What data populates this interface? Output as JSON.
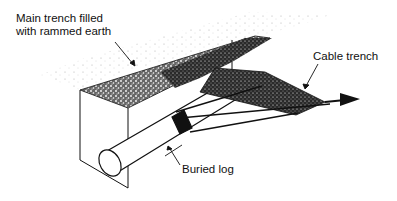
{
  "diagram": {
    "type": "technical-illustration",
    "labels": {
      "main_trench_line1": "Main trench filled",
      "main_trench_line2": "with rammed earth",
      "cable_trench": "Cable trench",
      "buried_log": "Buried log"
    },
    "colors": {
      "ink": "#111111",
      "background": "#ffffff",
      "stipple": "#222222"
    }
  }
}
